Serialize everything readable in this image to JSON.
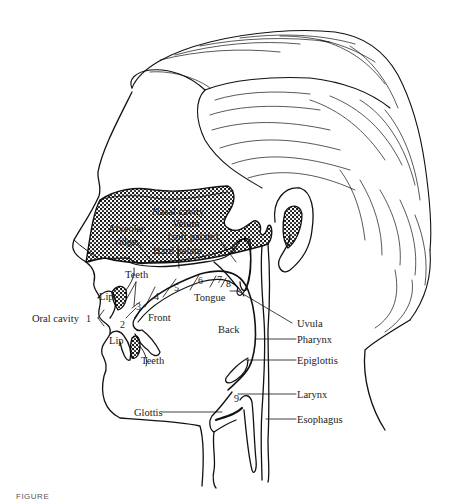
{
  "figure": {
    "type": "anatomical-diagram",
    "labels": {
      "nasal_cavity": "Nasal cavity",
      "alveolar_ridge_1": "Alveolar",
      "alveolar_ridge_2": "ridge",
      "velum_1": "Velum",
      "velum_2": "(soft palate)",
      "hard_palate": "Hard palate",
      "teeth_upper": "Teeth",
      "lip_upper": "Lip",
      "oral_cavity": "Oral cavity",
      "lip_lower": "Lip",
      "teeth_lower": "Teeth",
      "front": "Front",
      "tongue": "Tongue",
      "back": "Back",
      "uvula": "Uvula",
      "pharynx": "Pharynx",
      "epiglottis": "Epiglottis",
      "larynx": "Larynx",
      "glottis": "Glottis",
      "esophagus": "Esophagus"
    },
    "places_of_articulation": [
      "1",
      "2",
      "3",
      "4",
      "5",
      "6",
      "7",
      "8",
      "9"
    ]
  },
  "caption": {
    "text": "FIGURE"
  }
}
